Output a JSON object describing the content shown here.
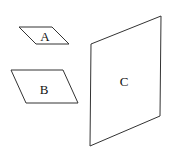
{
  "diagram": {
    "type": "planes",
    "width": 169,
    "height": 152,
    "shapes": [
      {
        "id": "A",
        "label": "A",
        "kind": "parallelogram",
        "points": "19,27 52,27 69,44 36,44",
        "label_pos": [
          45,
          36
        ]
      },
      {
        "id": "B",
        "label": "B",
        "kind": "parallelogram",
        "points": "11,70 63,70 78,103 26,103",
        "label_pos": [
          44,
          89
        ]
      },
      {
        "id": "C",
        "label": "C",
        "kind": "parallelogram",
        "points": "91,44 161,16 160,116 90,146",
        "label_pos": [
          124,
          81
        ]
      }
    ],
    "colors": {
      "stroke": "#333333",
      "fill": "#ffffff",
      "text": "#111111"
    }
  }
}
